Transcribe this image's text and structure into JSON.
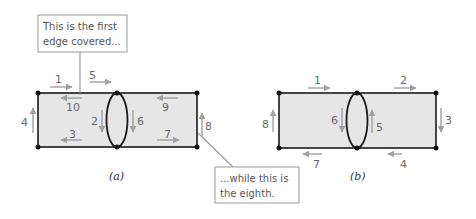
{
  "colors": {
    "region_fill": "#e6e6e6",
    "edge": "#1a1a1a",
    "arrow": "#a0a0a0",
    "label": "#6a6a6a",
    "callout_border": "#9a9a9a"
  },
  "callouts": {
    "first": {
      "line1": "This is the first",
      "line2": "edge covered..."
    },
    "eighth": {
      "line1": "...while this is",
      "line2": "the eighth."
    }
  },
  "diagram_a": {
    "caption": "(a)",
    "edge_labels": {
      "top_left_outer": "1",
      "top_right_outer": "5",
      "top_left_inner": "10",
      "top_right_inner": "9",
      "left": "4",
      "ellipse_left": "2",
      "ellipse_right": "6",
      "right": "8",
      "bottom_left": "3",
      "bottom_right": "7"
    }
  },
  "diagram_b": {
    "caption": "(b)",
    "edge_labels": {
      "top_left": "1",
      "top_right": "2",
      "right": "3",
      "bottom_right": "4",
      "ellipse_right": "5",
      "ellipse_left": "6",
      "bottom_left": "7",
      "left": "8"
    }
  }
}
